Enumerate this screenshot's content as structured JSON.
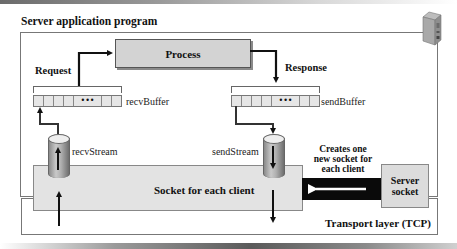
{
  "title": "Server application program",
  "process": {
    "label": "Process"
  },
  "flows": {
    "request_label": "Request",
    "response_label": "Response"
  },
  "buffers": {
    "recv": {
      "label": "recvBuffer",
      "ellipsis": "•••"
    },
    "send": {
      "label": "sendBuffer",
      "ellipsis": "•••"
    }
  },
  "streams": {
    "recv": {
      "label": "recvStream",
      "direction": "up"
    },
    "send": {
      "label": "sendStream",
      "direction": "down"
    }
  },
  "socket": {
    "label": "Socket for each client"
  },
  "server_socket": {
    "line1": "Server",
    "line2": "socket"
  },
  "creates_note": {
    "line1": "Creates one",
    "line2": "new socket for",
    "line3": "each client"
  },
  "transport": {
    "label": "Transport layer (TCP)"
  },
  "icons": {
    "server": "server-tower-icon"
  },
  "colors": {
    "process_fill": "#d3d3d3",
    "socket_fill": "#e3e3e3",
    "server_socket_fill": "#dcdcdc",
    "black_bar": "#0a0a0a",
    "arrow": "#111111"
  }
}
